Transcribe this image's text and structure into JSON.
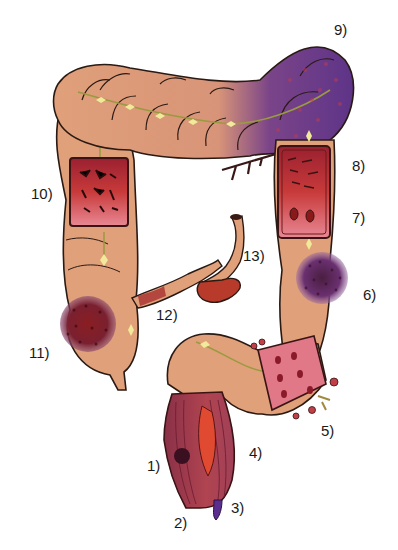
{
  "figure": {
    "labels": [
      {
        "id": "1",
        "text": "1)",
        "x": 147,
        "y": 458
      },
      {
        "id": "2",
        "text": "2)",
        "x": 174,
        "y": 515
      },
      {
        "id": "3",
        "text": "3)",
        "x": 231,
        "y": 500
      },
      {
        "id": "4",
        "text": "4)",
        "x": 249,
        "y": 445
      },
      {
        "id": "5",
        "text": "5)",
        "x": 321,
        "y": 423
      },
      {
        "id": "6",
        "text": "6)",
        "x": 363,
        "y": 287
      },
      {
        "id": "7",
        "text": "7)",
        "x": 352,
        "y": 210
      },
      {
        "id": "8",
        "text": "8)",
        "x": 352,
        "y": 158
      },
      {
        "id": "9",
        "text": "9)",
        "x": 334,
        "y": 22
      },
      {
        "id": "10",
        "text": "10)",
        "x": 31,
        "y": 186
      },
      {
        "id": "11",
        "text": "11)",
        "x": 29,
        "y": 345
      },
      {
        "id": "12",
        "text": "12)",
        "x": 156,
        "y": 307
      },
      {
        "id": "13",
        "text": "13)",
        "x": 243,
        "y": 248
      }
    ]
  },
  "colors": {
    "bowel": "#e0a07a",
    "bowel_dark": "#c47e58",
    "outline": "#2a1a14",
    "mesentery": "#e8e38a",
    "purple_ischemia": "#6a3a8c",
    "mucosa_red": "#b8323a",
    "mucosa_pink": "#e07888",
    "tumor": "#7a1e28",
    "vein_purple": "#5a2e8e"
  }
}
